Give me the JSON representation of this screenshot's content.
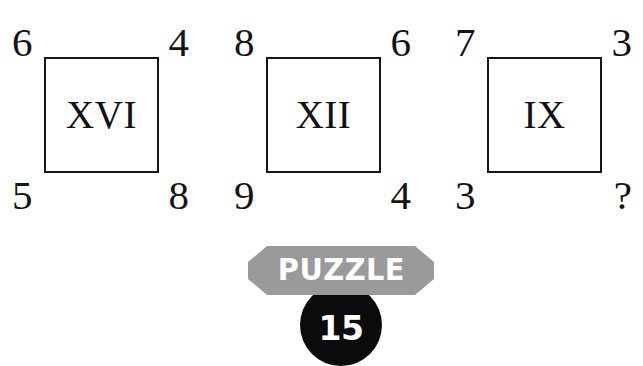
{
  "puzzle": {
    "panels": [
      {
        "name": "panel-1",
        "roman": "XVI",
        "top_left": "6",
        "top_right": "4",
        "bottom_left": "5",
        "bottom_right": "8"
      },
      {
        "name": "panel-2",
        "roman": "XII",
        "top_left": "8",
        "top_right": "6",
        "bottom_left": "9",
        "bottom_right": "4"
      },
      {
        "name": "panel-3",
        "roman": "IX",
        "top_left": "7",
        "top_right": "3",
        "bottom_left": "3",
        "bottom_right": "?"
      }
    ],
    "badge": {
      "banner_label": "PUZZLE",
      "number": "15",
      "banner_color": "#9a9a9a",
      "disc_color": "#0b0b0d",
      "text_color": "#ffffff"
    },
    "colors": {
      "background": "#ffffff",
      "ink": "#141414",
      "square_border": "#17171a"
    }
  }
}
